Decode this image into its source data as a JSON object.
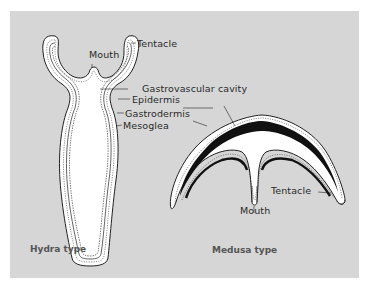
{
  "figure": {
    "background_color": "#d6d6d6",
    "hydra": {
      "caption": "Hydra type",
      "labels": {
        "mouth": "Mouth",
        "tentacle": "Tentacle",
        "gastrovascular_cavity": "Gastrovascular cavity",
        "epidermis": "Epidermis",
        "gastrodermis": "Gastrodermis",
        "mesoglea": "Mesoglea"
      }
    },
    "medusa": {
      "caption": "Medusa type",
      "labels": {
        "tentacle": "Tentacle",
        "mouth": "Mouth"
      }
    },
    "colors": {
      "body_fill": "#ffffff",
      "outline": "#222222",
      "mesoglea_fill": "#111111"
    }
  }
}
